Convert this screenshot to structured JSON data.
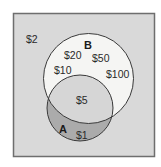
{
  "diagram": {
    "type": "venn",
    "colors": {
      "universe_fill": "#d9d9d9",
      "universe_border": "#6e6e6e",
      "b_only_fill": "#f5f5f3",
      "a_only_fill": "#ababab",
      "intersection_fill": "#d6d6d6",
      "stroke": "#3a3a3a"
    },
    "sets": {
      "a": {
        "label": "A"
      },
      "b": {
        "label": "B"
      }
    },
    "regions": {
      "outside": [
        "$2"
      ],
      "b_only": [
        "$20",
        "$50",
        "$10",
        "$100"
      ],
      "a_and_b": [
        "$5"
      ],
      "a_only": [
        "$1"
      ]
    }
  }
}
